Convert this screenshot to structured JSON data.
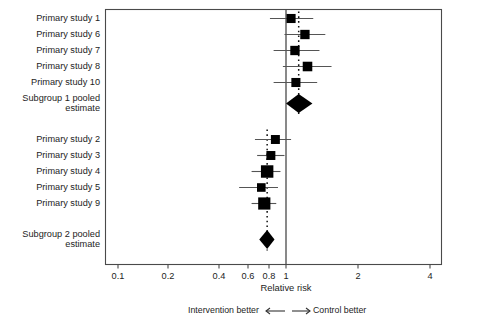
{
  "chart_data": {
    "type": "forest",
    "title": "",
    "xlabel": "Relative risk",
    "ylabel": "",
    "xscale": "log",
    "xlim": [
      0.085,
      4.6
    ],
    "ticks": [
      {
        "label": "0.1",
        "value": 0.1
      },
      {
        "label": "0.2",
        "value": 0.2
      },
      {
        "label": "0.4",
        "value": 0.4
      },
      {
        "label": "0.6",
        "value": 0.6
      },
      {
        "label": "0.8",
        "value": 0.8
      },
      {
        "label": "1",
        "value": 1
      },
      {
        "label": "2",
        "value": 2
      },
      {
        "label": "4",
        "value": 4
      }
    ],
    "reference_line": {
      "value": 1,
      "style": "solid"
    },
    "pooled_line": {
      "value": 1.13,
      "style": "dotted"
    },
    "grid": false,
    "rows": [
      {
        "label": "Primary study 1",
        "type": "study",
        "estimate": 1.05,
        "ci_low": 0.81,
        "ci_high": 1.3,
        "weight": 0.34
      },
      {
        "label": "Primary study 6",
        "type": "study",
        "estimate": 1.2,
        "ci_low": 0.98,
        "ci_high": 1.46,
        "weight": 0.36
      },
      {
        "label": "Primary study 7",
        "type": "study",
        "estimate": 1.09,
        "ci_low": 0.85,
        "ci_high": 1.38,
        "weight": 0.36
      },
      {
        "label": "Primary study 8",
        "type": "study",
        "estimate": 1.23,
        "ci_low": 0.96,
        "ci_high": 1.55,
        "weight": 0.38
      },
      {
        "label": "Primary study 10",
        "type": "study",
        "estimate": 1.1,
        "ci_low": 0.85,
        "ci_high": 1.35,
        "weight": 0.34
      },
      {
        "label": "Subgroup 1 pooled\nestimate",
        "type": "pooled",
        "estimate": 1.13,
        "ci_low": 1.0,
        "ci_high": 1.29
      },
      {
        "label": "Primary study 2",
        "type": "study",
        "estimate": 0.87,
        "ci_low": 0.66,
        "ci_high": 1.05,
        "weight": 0.33
      },
      {
        "label": "Primary study 3",
        "type": "study",
        "estimate": 0.82,
        "ci_low": 0.68,
        "ci_high": 0.98,
        "weight": 0.33
      },
      {
        "label": "Primary study 4",
        "type": "study",
        "estimate": 0.78,
        "ci_low": 0.63,
        "ci_high": 0.93,
        "weight": 0.62
      },
      {
        "label": "Primary study 5",
        "type": "study",
        "estimate": 0.72,
        "ci_low": 0.53,
        "ci_high": 0.9,
        "weight": 0.3
      },
      {
        "label": "Primary study 9",
        "type": "study",
        "estimate": 0.75,
        "ci_low": 0.63,
        "ci_high": 0.88,
        "weight": 0.6
      },
      {
        "label": "Subgroup 2 pooled\nestimate",
        "type": "pooled",
        "estimate": 0.78,
        "ci_low": 0.7,
        "ci_high": 0.86
      }
    ]
  },
  "footer": {
    "left_text": "Intervention better",
    "right_text": "Control better",
    "left_arrow": "left-arrow-icon",
    "right_arrow": "right-arrow-icon"
  },
  "colors": {
    "marker": "#000000",
    "ci_line": "#555555",
    "axis": "#4a4a4a",
    "reference": "#4a4a4a",
    "text": "#1d1d1d"
  }
}
